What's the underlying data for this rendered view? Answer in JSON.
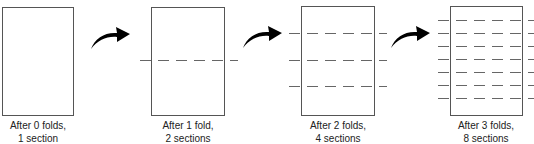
{
  "diagram": {
    "panels": [
      {
        "folds": 0,
        "sections": 1,
        "caption_line1": "After 0 folds,",
        "caption_line2": "1 section"
      },
      {
        "folds": 1,
        "sections": 2,
        "caption_line1": "After 1 fold,",
        "caption_line2": "2 sections"
      },
      {
        "folds": 2,
        "sections": 4,
        "caption_line1": "After 2 folds,",
        "caption_line2": "4 sections"
      },
      {
        "folds": 3,
        "sections": 8,
        "caption_line1": "After 3 folds,",
        "caption_line2": "8 sections"
      }
    ],
    "arrows": [
      {
        "icon": "curved-arrow-right-icon"
      },
      {
        "icon": "curved-arrow-right-icon"
      },
      {
        "icon": "curved-arrow-right-icon"
      }
    ],
    "colors": {
      "sheet_border": "#555555",
      "fold_line": "#666666",
      "arrow": "#000000",
      "text": "#222222"
    }
  }
}
